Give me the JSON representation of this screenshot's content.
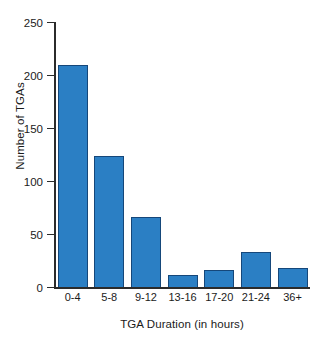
{
  "chart_data": {
    "type": "bar",
    "title": "",
    "xlabel": "TGA Duration (in hours)",
    "ylabel": "Number of TGAs",
    "categories": [
      "0-4",
      "5-8",
      "9-12",
      "13-16",
      "17-20",
      "21-24",
      "36+"
    ],
    "values": [
      209,
      124,
      66,
      11,
      16,
      33,
      18
    ],
    "ylim": [
      0,
      250
    ],
    "yticks": [
      0,
      50,
      100,
      150,
      200,
      250
    ],
    "ytick_labels": [
      "0",
      "50",
      "100",
      "150",
      "200",
      "250"
    ],
    "grid": false,
    "legend": null,
    "bar_color": "#2b7fc4",
    "bar_edge_color": "#15477a",
    "axis_color": "#2b2b2b",
    "background": "#ffffff"
  }
}
